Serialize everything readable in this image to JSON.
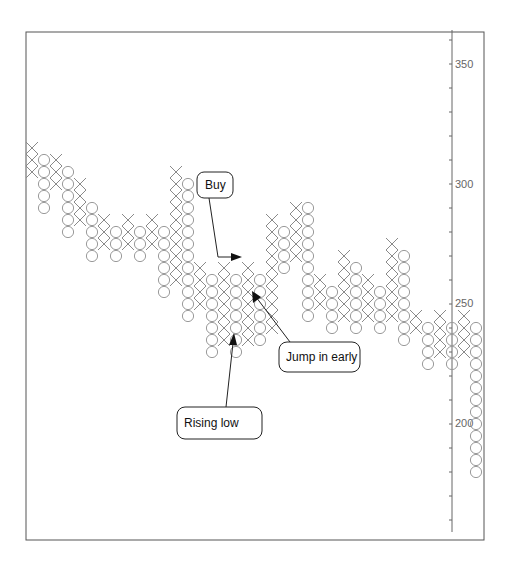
{
  "chart_data": {
    "type": "point-and-figure",
    "title": "",
    "xlabel": "",
    "ylabel": "",
    "box_size": 5,
    "ylim": [
      160,
      370
    ],
    "y_ticks_labeled": [
      350,
      300,
      250,
      200
    ],
    "y_minor_tick_step": 10,
    "grid": false,
    "axis_position": "right",
    "columns": [
      {
        "type": "X",
        "low": 305,
        "high": 315
      },
      {
        "type": "O",
        "low": 290,
        "high": 310
      },
      {
        "type": "X",
        "low": 300,
        "high": 310
      },
      {
        "type": "O",
        "low": 280,
        "high": 305
      },
      {
        "type": "X",
        "low": 285,
        "high": 300
      },
      {
        "type": "O",
        "low": 270,
        "high": 290
      },
      {
        "type": "X",
        "low": 275,
        "high": 285
      },
      {
        "type": "O",
        "low": 270,
        "high": 280
      },
      {
        "type": "X",
        "low": 275,
        "high": 285
      },
      {
        "type": "O",
        "low": 270,
        "high": 280
      },
      {
        "type": "X",
        "low": 275,
        "high": 285
      },
      {
        "type": "O",
        "low": 255,
        "high": 280
      },
      {
        "type": "X",
        "low": 260,
        "high": 305
      },
      {
        "type": "O",
        "low": 245,
        "high": 300
      },
      {
        "type": "X",
        "low": 250,
        "high": 265
      },
      {
        "type": "O",
        "low": 230,
        "high": 260
      },
      {
        "type": "X",
        "low": 235,
        "high": 265
      },
      {
        "type": "O",
        "low": 230,
        "high": 260
      },
      {
        "type": "X",
        "low": 235,
        "high": 265
      },
      {
        "type": "O",
        "low": 235,
        "high": 260
      },
      {
        "type": "X",
        "low": 240,
        "high": 285
      },
      {
        "type": "O",
        "low": 265,
        "high": 280
      },
      {
        "type": "X",
        "low": 270,
        "high": 290
      },
      {
        "type": "O",
        "low": 245,
        "high": 290
      },
      {
        "type": "X",
        "low": 250,
        "high": 260
      },
      {
        "type": "O",
        "low": 240,
        "high": 255
      },
      {
        "type": "X",
        "low": 245,
        "high": 270
      },
      {
        "type": "O",
        "low": 240,
        "high": 265
      },
      {
        "type": "X",
        "low": 245,
        "high": 260
      },
      {
        "type": "O",
        "low": 240,
        "high": 255
      },
      {
        "type": "X",
        "low": 245,
        "high": 275
      },
      {
        "type": "O",
        "low": 235,
        "high": 270
      },
      {
        "type": "X",
        "low": 240,
        "high": 245
      },
      {
        "type": "O",
        "low": 225,
        "high": 240
      },
      {
        "type": "X",
        "low": 230,
        "high": 245
      },
      {
        "type": "O",
        "low": 225,
        "high": 240
      },
      {
        "type": "X",
        "low": 230,
        "high": 245
      },
      {
        "type": "O",
        "low": 180,
        "high": 240
      }
    ],
    "annotations": [
      {
        "text": "Buy",
        "points_to": "X column breakout near 270"
      },
      {
        "text": "Jump in early",
        "points_to": "X column near 255"
      },
      {
        "text": "Rising low",
        "points_to": "O column low near 235"
      }
    ]
  },
  "annotations": {
    "buy": "Buy",
    "jump": "Jump in early",
    "rising": "Rising low"
  },
  "axis": {
    "labels": [
      "350",
      "300",
      "250",
      "200"
    ]
  }
}
